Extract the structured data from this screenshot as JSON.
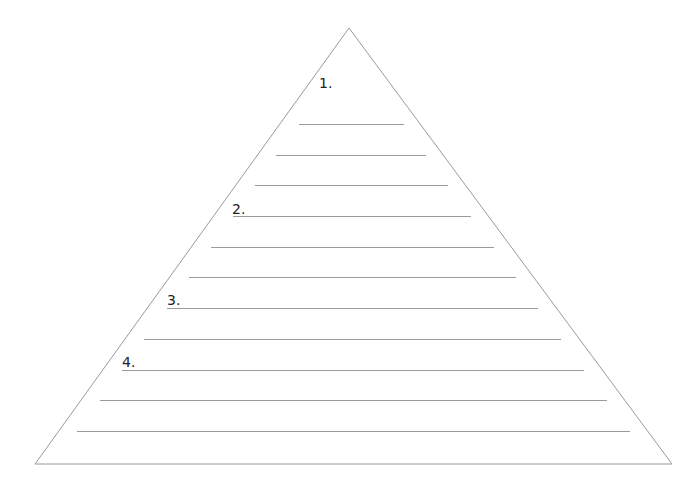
{
  "diagram": {
    "type": "pyramid-worksheet",
    "colors": {
      "outline": "#9a9a9a",
      "lines": "#9a9a9a",
      "text": "#222222",
      "background": "#ffffff"
    },
    "triangle": {
      "apex": [
        349,
        28
      ],
      "base_left": [
        35,
        464
      ],
      "base_right": [
        672,
        464
      ]
    },
    "sections": [
      {
        "label": "1.",
        "pos": [
          319,
          76
        ]
      },
      {
        "label": "2.",
        "pos": [
          232,
          202
        ]
      },
      {
        "label": "3.",
        "pos": [
          167,
          293
        ]
      },
      {
        "label": "4.",
        "pos": [
          122,
          355
        ]
      }
    ],
    "write_lines": [
      {
        "y": 124,
        "x1": 299,
        "x2": 404
      },
      {
        "y": 155,
        "x1": 276,
        "x2": 426
      },
      {
        "y": 185,
        "x1": 255,
        "x2": 448
      },
      {
        "y": 216,
        "x1": 233,
        "x2": 471
      },
      {
        "y": 247,
        "x1": 211,
        "x2": 494
      },
      {
        "y": 277,
        "x1": 189,
        "x2": 516
      },
      {
        "y": 308,
        "x1": 167,
        "x2": 538
      },
      {
        "y": 339,
        "x1": 144,
        "x2": 561
      },
      {
        "y": 370,
        "x1": 122,
        "x2": 584
      },
      {
        "y": 400,
        "x1": 100,
        "x2": 607
      },
      {
        "y": 431,
        "x1": 77,
        "x2": 630
      }
    ]
  }
}
